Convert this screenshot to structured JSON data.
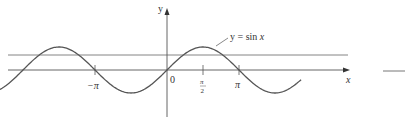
{
  "chart_data": {
    "type": "line",
    "title": "",
    "xlabel": "x",
    "ylabel": "y",
    "series": [
      {
        "name": "y = sin x",
        "function": "sin(x)",
        "x_range": [
          -8.7,
          5.85
        ]
      }
    ],
    "reference_lines": [
      {
        "type": "horizontal",
        "y": 0.65,
        "description": "horizontal line y = c (0 < c < 1)"
      }
    ],
    "x_ticks": [
      {
        "value": -3.14159,
        "label": "−π"
      },
      {
        "value": 0,
        "label": "0"
      },
      {
        "value": 1.5708,
        "label": "π/2"
      },
      {
        "value": 3.14159,
        "label": "π"
      }
    ],
    "ylim": [
      -1.3,
      2.6
    ],
    "grid": false,
    "legend": "none",
    "annotations": [
      {
        "text": "y = sin x",
        "points_to": "curve near x ≈ 1.9"
      }
    ]
  },
  "labels": {
    "y_axis": "y",
    "x_axis": "x",
    "origin": "0",
    "neg_pi": "−π",
    "pi": "π",
    "half_pi_num": "π",
    "half_pi_den": "2",
    "curve_eq_prefix": "y = sin ",
    "curve_eq_var": "x"
  },
  "colors": {
    "curve": "#555555",
    "axes": "#555555",
    "ref_line": "#777777"
  }
}
